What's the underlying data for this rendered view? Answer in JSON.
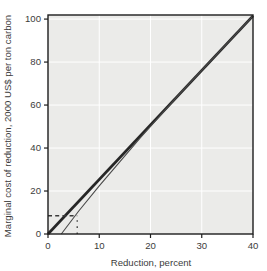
{
  "chart_data": {
    "type": "line",
    "title": "",
    "xlabel": "Reduction, percent",
    "ylabel": "Marginal cost of reduction, 2000 US$ per ton carbon",
    "xlim": [
      0,
      40
    ],
    "ylim": [
      0,
      101.9
    ],
    "x_ticks": [
      0,
      10,
      20,
      30,
      40
    ],
    "y_ticks": [
      0,
      20,
      40,
      60,
      80,
      100
    ],
    "grid": true,
    "legend": "none",
    "colors": {
      "plot_background": "#ebebe9",
      "gridline": "#ffffff",
      "frame": "#1d1d1d",
      "thick_line": "#262626",
      "thin_line": "#4a4a4a",
      "guide": "#3a3a3a",
      "text": "#3c3c3c"
    },
    "series": [
      {
        "name": "marginal-cost-upper",
        "style": "thick-solid",
        "width": 2.7,
        "x": [
          0,
          40
        ],
        "y": [
          0,
          101.5
        ]
      },
      {
        "name": "marginal-cost-lower",
        "style": "thin-solid",
        "width": 1.1,
        "x": [
          2.6,
          6,
          10,
          14,
          18,
          22,
          26,
          32,
          40
        ],
        "y": [
          0,
          10.7,
          22.4,
          33.6,
          44.7,
          55.4,
          66.0,
          81.2,
          101.5
        ]
      },
      {
        "name": "horizontal-guide",
        "style": "dashed",
        "width": 1.3,
        "dash": "4 3.2",
        "x": [
          0,
          5.7
        ],
        "y": [
          8.5,
          8.5
        ]
      },
      {
        "name": "vertical-guide",
        "style": "dotted",
        "width": 1.3,
        "dash": "1.6 4.5",
        "x": [
          5.7,
          5.7
        ],
        "y": [
          0,
          8.2
        ]
      }
    ]
  }
}
